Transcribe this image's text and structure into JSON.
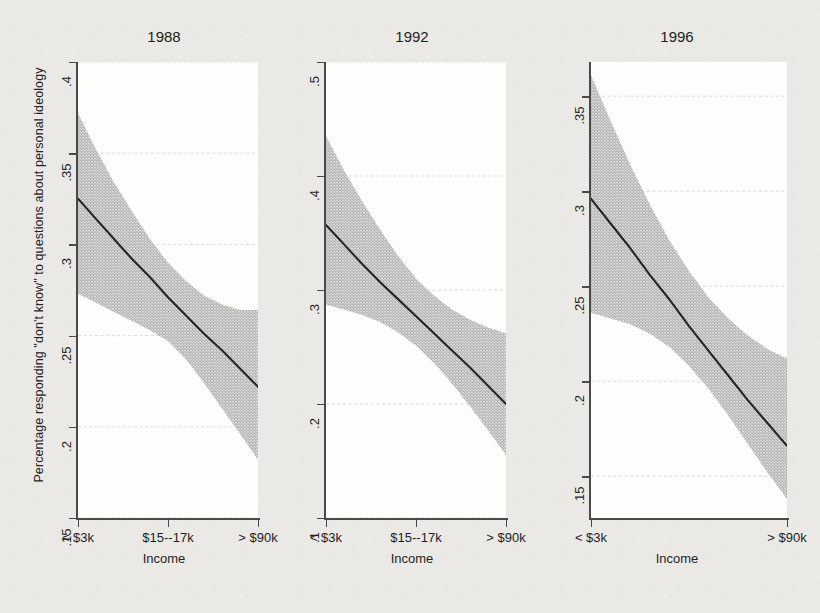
{
  "figure": {
    "y_axis_label": "Percentage responding \"don't know\" to questions about personal ideology",
    "background_color": "#eae9e6",
    "plot_background_color": "#fdfdfc",
    "line_color": "#262626",
    "band_color": "#c9c9c9",
    "gridline_color": "#cfcfd6"
  },
  "chart_data": {
    "type": "line",
    "title": "",
    "subtitle": "",
    "xlabel": "Income",
    "ylabel": "Percentage responding \"don't know\" to questions about personal ideology",
    "grid": true,
    "legend": "none",
    "panels": [
      {
        "title": "1988",
        "xlabel": "Income",
        "xticklabels": [
          "< $3k",
          "$15--17k",
          "> $90k"
        ],
        "xtick_positions": [
          0.0,
          0.5,
          1.0
        ],
        "yticklabels": [
          ".15",
          ".2",
          ".25",
          ".3",
          ".35",
          ".4"
        ],
        "ytick_values": [
          0.15,
          0.2,
          0.25,
          0.3,
          0.35,
          0.4
        ],
        "ylim": [
          0.15,
          0.4
        ],
        "xlim": [
          0,
          1
        ],
        "series": [
          {
            "name": "fitted",
            "x": [
              0.0,
              0.1,
              0.2,
              0.3,
              0.4,
              0.5,
              0.6,
              0.7,
              0.8,
              0.9,
              1.0
            ],
            "values": [
              0.325,
              0.314,
              0.303,
              0.292,
              0.282,
              0.271,
              0.261,
              0.251,
              0.242,
              0.232,
              0.222
            ]
          },
          {
            "name": "ci_upper",
            "x": [
              0.0,
              0.1,
              0.2,
              0.3,
              0.4,
              0.5,
              0.6,
              0.7,
              0.8,
              0.9,
              1.0
            ],
            "values": [
              0.372,
              0.352,
              0.334,
              0.318,
              0.303,
              0.29,
              0.28,
              0.272,
              0.267,
              0.264,
              0.264
            ]
          },
          {
            "name": "ci_lower",
            "x": [
              0.0,
              0.1,
              0.2,
              0.3,
              0.4,
              0.5,
              0.6,
              0.7,
              0.8,
              0.9,
              1.0
            ],
            "values": [
              0.273,
              0.268,
              0.263,
              0.258,
              0.253,
              0.247,
              0.237,
              0.224,
              0.21,
              0.196,
              0.182
            ]
          }
        ]
      },
      {
        "title": "1992",
        "xlabel": "Income",
        "xticklabels": [
          "< $3k",
          "$15--17k",
          "> $90k"
        ],
        "xtick_positions": [
          0.0,
          0.5,
          1.0
        ],
        "yticklabels": [
          ".1",
          ".2",
          ".3",
          ".4",
          ".5"
        ],
        "ytick_values": [
          0.1,
          0.2,
          0.3,
          0.4,
          0.5
        ],
        "ylim": [
          0.1,
          0.5
        ],
        "xlim": [
          0,
          1
        ],
        "series": [
          {
            "name": "fitted",
            "x": [
              0.0,
              0.1,
              0.2,
              0.3,
              0.4,
              0.5,
              0.6,
              0.7,
              0.8,
              0.9,
              1.0
            ],
            "values": [
              0.357,
              0.34,
              0.323,
              0.307,
              0.292,
              0.277,
              0.262,
              0.247,
              0.232,
              0.216,
              0.2
            ]
          },
          {
            "name": "ci_upper",
            "x": [
              0.0,
              0.1,
              0.2,
              0.3,
              0.4,
              0.5,
              0.6,
              0.7,
              0.8,
              0.9,
              1.0
            ],
            "values": [
              0.435,
              0.405,
              0.378,
              0.353,
              0.33,
              0.31,
              0.295,
              0.283,
              0.274,
              0.267,
              0.262
            ]
          },
          {
            "name": "ci_lower",
            "x": [
              0.0,
              0.1,
              0.2,
              0.3,
              0.4,
              0.5,
              0.6,
              0.7,
              0.8,
              0.9,
              1.0
            ],
            "values": [
              0.287,
              0.283,
              0.278,
              0.272,
              0.263,
              0.251,
              0.236,
              0.218,
              0.198,
              0.177,
              0.155
            ]
          }
        ]
      },
      {
        "title": "1996",
        "xlabel": "Income",
        "xticklabels": [
          "< $3k",
          "> $90k"
        ],
        "xtick_positions": [
          0.0,
          1.0
        ],
        "yticklabels": [
          ".15",
          ".2",
          ".25",
          ".3",
          ".35"
        ],
        "ytick_values": [
          0.15,
          0.2,
          0.25,
          0.3,
          0.35
        ],
        "ylim": [
          0.128,
          0.368
        ],
        "xlim": [
          0,
          1
        ],
        "series": [
          {
            "name": "fitted",
            "x": [
              0.0,
              0.1,
              0.2,
              0.3,
              0.4,
              0.5,
              0.6,
              0.7,
              0.8,
              0.9,
              1.0
            ],
            "values": [
              0.296,
              0.283,
              0.27,
              0.256,
              0.243,
              0.229,
              0.216,
              0.203,
              0.19,
              0.178,
              0.166
            ]
          },
          {
            "name": "ci_upper",
            "x": [
              0.0,
              0.1,
              0.2,
              0.3,
              0.4,
              0.5,
              0.6,
              0.7,
              0.8,
              0.9,
              1.0
            ],
            "values": [
              0.361,
              0.337,
              0.314,
              0.293,
              0.274,
              0.258,
              0.244,
              0.233,
              0.224,
              0.217,
              0.212
            ]
          },
          {
            "name": "ci_lower",
            "x": [
              0.0,
              0.1,
              0.2,
              0.3,
              0.4,
              0.5,
              0.6,
              0.7,
              0.8,
              0.9,
              1.0
            ],
            "values": [
              0.236,
              0.233,
              0.23,
              0.225,
              0.218,
              0.208,
              0.196,
              0.182,
              0.167,
              0.152,
              0.138
            ]
          }
        ]
      }
    ]
  }
}
